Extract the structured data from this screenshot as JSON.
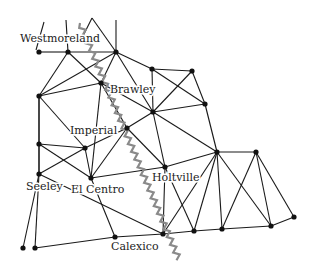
{
  "map": {
    "colors": {
      "edge": "#1a1a1a",
      "node": "#111111",
      "fault": "#8a8a8a",
      "label": "#222222",
      "background": "#ffffff"
    },
    "labels": [
      {
        "id": "westmoreland",
        "text": "Westmoreland",
        "x": 20,
        "y": 42
      },
      {
        "id": "brawley",
        "text": "Brawley",
        "x": 110,
        "y": 93
      },
      {
        "id": "imperial",
        "text": "Imperial",
        "x": 70,
        "y": 134
      },
      {
        "id": "seeley",
        "text": "Seeley",
        "x": 26,
        "y": 190
      },
      {
        "id": "el-centro",
        "text": "El",
        "x": 71,
        "y": 193
      },
      {
        "id": "centro",
        "text": "Centro",
        "x": 86,
        "y": 193
      },
      {
        "id": "holtville",
        "text": "Holtville",
        "x": 152,
        "y": 181
      },
      {
        "id": "calexico",
        "text": "Calexico",
        "x": 111,
        "y": 250
      }
    ],
    "nodes": {
      "A": [
        39,
        52
      ],
      "B": [
        68,
        52
      ],
      "C": [
        116,
        52
      ],
      "D": [
        101,
        83
      ],
      "E": [
        39,
        96
      ],
      "F": [
        152,
        69
      ],
      "G": [
        192,
        71
      ],
      "H": [
        205,
        104
      ],
      "I": [
        153,
        112
      ],
      "J": [
        127,
        128
      ],
      "K": [
        85,
        148
      ],
      "L": [
        39,
        144
      ],
      "M": [
        39,
        174
      ],
      "N": [
        91,
        178
      ],
      "O": [
        165,
        167
      ],
      "P": [
        217,
        152
      ],
      "Q": [
        256,
        152
      ],
      "R": [
        294,
        217
      ],
      "S": [
        271,
        226
      ],
      "T": [
        222,
        229
      ],
      "U": [
        194,
        231
      ],
      "V": [
        163,
        234
      ],
      "W": [
        115,
        237
      ],
      "X": [
        35,
        248
      ],
      "Y": [
        23,
        248
      ]
    },
    "edges": [
      [
        "A",
        "B"
      ],
      [
        "B",
        "C"
      ],
      [
        "B",
        "E"
      ],
      [
        "B",
        "D"
      ],
      [
        "C",
        "D"
      ],
      [
        "C",
        "E"
      ],
      [
        "C",
        "F"
      ],
      [
        "C",
        "I"
      ],
      [
        "D",
        "E"
      ],
      [
        "D",
        "I"
      ],
      [
        "D",
        "J"
      ],
      [
        "D",
        "N"
      ],
      [
        "E",
        "L"
      ],
      [
        "E",
        "K"
      ],
      [
        "E",
        "M"
      ],
      [
        "F",
        "G"
      ],
      [
        "F",
        "I"
      ],
      [
        "F",
        "H"
      ],
      [
        "G",
        "I"
      ],
      [
        "G",
        "H"
      ],
      [
        "H",
        "I"
      ],
      [
        "H",
        "P"
      ],
      [
        "I",
        "J"
      ],
      [
        "I",
        "O"
      ],
      [
        "I",
        "P"
      ],
      [
        "J",
        "K"
      ],
      [
        "J",
        "N"
      ],
      [
        "J",
        "O"
      ],
      [
        "K",
        "L"
      ],
      [
        "K",
        "N"
      ],
      [
        "K",
        "M"
      ],
      [
        "L",
        "M"
      ],
      [
        "L",
        "N"
      ],
      [
        "M",
        "V"
      ],
      [
        "M",
        "Y"
      ],
      [
        "M",
        "X"
      ],
      [
        "N",
        "O"
      ],
      [
        "N",
        "W"
      ],
      [
        "O",
        "P"
      ],
      [
        "O",
        "V"
      ],
      [
        "O",
        "U"
      ],
      [
        "P",
        "Q"
      ],
      [
        "P",
        "V"
      ],
      [
        "P",
        "U"
      ],
      [
        "P",
        "T"
      ],
      [
        "P",
        "S"
      ],
      [
        "Q",
        "T"
      ],
      [
        "Q",
        "S"
      ],
      [
        "Q",
        "R"
      ],
      [
        "R",
        "S"
      ],
      [
        "S",
        "T"
      ],
      [
        "T",
        "U"
      ],
      [
        "U",
        "V"
      ],
      [
        "V",
        "W"
      ],
      [
        "W",
        "X"
      ]
    ],
    "stubs": [
      [
        [
          44,
          22
        ],
        [
          36,
          50
        ]
      ],
      [
        [
          66,
          20
        ],
        [
          68,
          52
        ]
      ],
      [
        [
          116,
          20
        ],
        [
          116,
          52
        ]
      ],
      [
        [
          92,
          18
        ],
        [
          116,
          52
        ]
      ],
      [
        [
          92,
          18
        ],
        [
          82,
          38
        ]
      ]
    ],
    "fault_line": {
      "start": [
        80,
        23
      ],
      "end": [
        180,
        262
      ],
      "label": "fault-line"
    }
  }
}
